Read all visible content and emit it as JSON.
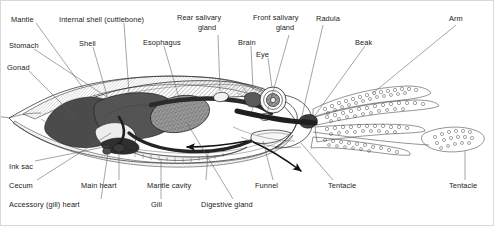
{
  "diagram": {
    "background_color": "#ffffff",
    "line_color": "#1d1d1d",
    "label_color": "#1b1b1b",
    "accent_dark": "#4a4a4a",
    "accent_mid": "#8d8d8d",
    "accent_light": "#d6d6d6",
    "width": 494,
    "height": 226
  },
  "labels": {
    "mantle": "Mantle",
    "stomach": "Stomach",
    "gonad": "Gonad",
    "internal_shell": "Internal shell  (cuttlebone)",
    "shell": "Shell",
    "esophagus": "Esophagus",
    "rear_salivary_line1": "Rear salivary",
    "rear_salivary_line2": "gland",
    "brain": "Brain",
    "front_salivary_line1": "Front salivary",
    "front_salivary_line2": "gland",
    "eye": "Eye",
    "radula": "Radula",
    "beak": "Beak",
    "arm": "Arm",
    "ink_sac": "Ink sac",
    "cecum": "Cecum",
    "accessory_gill_heart": "Accessory (gill) heart",
    "main_heart": "Main heart",
    "gill": "Gill",
    "mantle_cavity": "Mantle cavity",
    "digestive_gland": "Digestive gland",
    "funnel": "Funnel",
    "tentacle_mid": "Tentacle",
    "tentacle_right": "Tentacle"
  },
  "flow_arrows": [
    {
      "name": "water-intake-arrow",
      "direction": "left"
    },
    {
      "name": "funnel-jet-arrow",
      "direction": "down-right"
    }
  ]
}
